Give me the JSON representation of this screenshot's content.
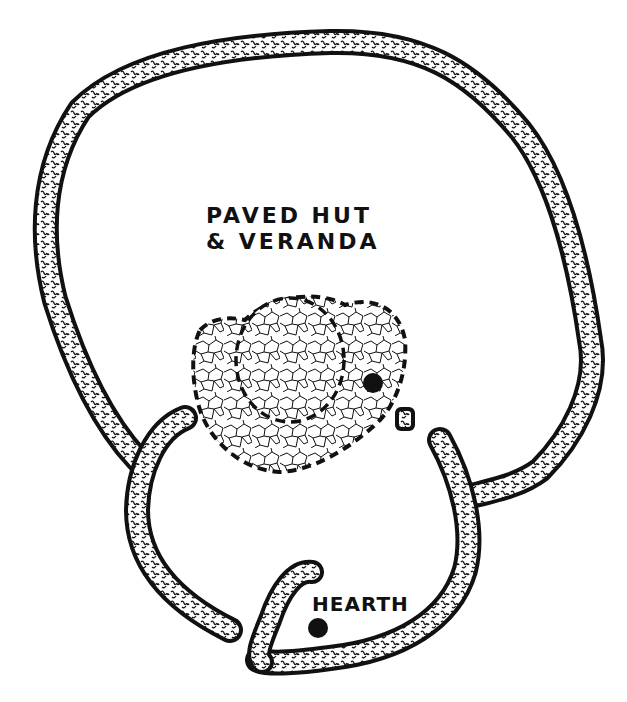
{
  "diagram": {
    "type": "archaeological site plan",
    "labels": {
      "hut_line1": "PAVED HUT",
      "hut_line2": "& VERANDA",
      "hearth": "HEARTH"
    },
    "colors": {
      "ink": "#111111",
      "background": "#ffffff",
      "wall_fill_texture": "#ffffff"
    },
    "features": [
      {
        "name": "outer-enclosure-wall",
        "shape": "large irregular loop"
      },
      {
        "name": "inner-enclosure-wall",
        "shape": "lower ring with entrance gaps"
      },
      {
        "name": "entrance-wall-hook",
        "shape": "curved wall segment"
      },
      {
        "name": "paved-hut-floor",
        "shape": "dashed circle with paving"
      },
      {
        "name": "veranda-paving",
        "shape": "dashed lobes around hut"
      },
      {
        "name": "post-hole",
        "shape": "filled dot"
      },
      {
        "name": "stone-block",
        "shape": "small square"
      },
      {
        "name": "hearth-dot",
        "shape": "filled dot"
      }
    ]
  }
}
